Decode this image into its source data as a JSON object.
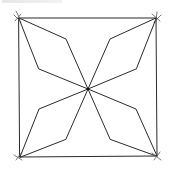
{
  "diagram": {
    "type": "hand-drawn geometric figure",
    "stroke_color": "#2a2a2a",
    "background": "#ffffff",
    "square": {
      "corners": [
        [
          19,
          18
        ],
        [
          156,
          18
        ],
        [
          157,
          156
        ],
        [
          20,
          157
        ]
      ]
    },
    "center": [
      88,
      89
    ],
    "petals": [
      {
        "name": "top-left",
        "points": [
          [
            19,
            18
          ],
          [
            66,
            39
          ],
          [
            88,
            89
          ],
          [
            39,
            69
          ]
        ]
      },
      {
        "name": "top-right",
        "points": [
          [
            156,
            18
          ],
          [
            110,
            39
          ],
          [
            88,
            89
          ],
          [
            136,
            69
          ]
        ]
      },
      {
        "name": "bottom-left",
        "points": [
          [
            20,
            157
          ],
          [
            39,
            109
          ],
          [
            88,
            89
          ],
          [
            66,
            139
          ]
        ]
      },
      {
        "name": "bottom-right",
        "points": [
          [
            157,
            156
          ],
          [
            136,
            109
          ],
          [
            88,
            89
          ],
          [
            110,
            139
          ]
        ]
      }
    ]
  }
}
